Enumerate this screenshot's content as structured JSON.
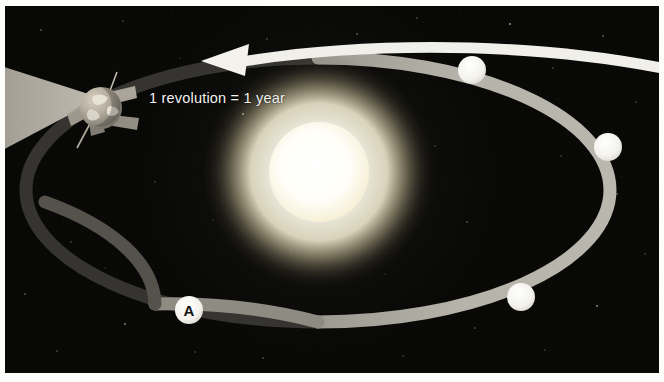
{
  "figure": {
    "name": "earth-orbit-around-sun-diagram",
    "border_color": "#fdfdfb",
    "space_background": "#080807"
  },
  "annotation": {
    "revolution_label": "1 revolution = 1 year",
    "direction_arrow_name": "counterclockwise-orbit-arrow",
    "arrow_color": "#f0efe9"
  },
  "sun": {
    "label": "Sun",
    "core_color": "#ffffff",
    "glow_color": "#fffbe8",
    "cx": 320,
    "cy": 172,
    "core_radius": 46
  },
  "earth": {
    "label": "Earth",
    "cx": 96,
    "cy": 102,
    "radius": 21,
    "body_color": "#b9b2a4",
    "panel_color": "#a9a396"
  },
  "sunlight_cone": {
    "label": "sunlight-shadow-cone",
    "color": "#b9b4a8"
  },
  "orbit": {
    "label": "Earth orbital path",
    "lit_color": "#b4b1a8",
    "shadow_color": "#3a3833",
    "center_x": 318,
    "center_y": 184,
    "radius_x": 292,
    "radius_y": 132,
    "stroke_width": 13
  },
  "markers": [
    {
      "id": "position-a",
      "label": "A",
      "x": 190,
      "y": 310,
      "r": 14,
      "has_label": true,
      "fill": "#f4f3ee"
    },
    {
      "id": "position-top-right",
      "label": "",
      "x": 473,
      "y": 70,
      "r": 14,
      "has_label": false,
      "fill": "#f4f3ee"
    },
    {
      "id": "position-right",
      "label": "",
      "x": 609,
      "y": 147,
      "r": 14,
      "has_label": false,
      "fill": "#f0efe9"
    },
    {
      "id": "position-bottom-right",
      "label": "",
      "x": 522,
      "y": 297,
      "r": 14,
      "has_label": false,
      "fill": "#f4f3ee"
    }
  ]
}
